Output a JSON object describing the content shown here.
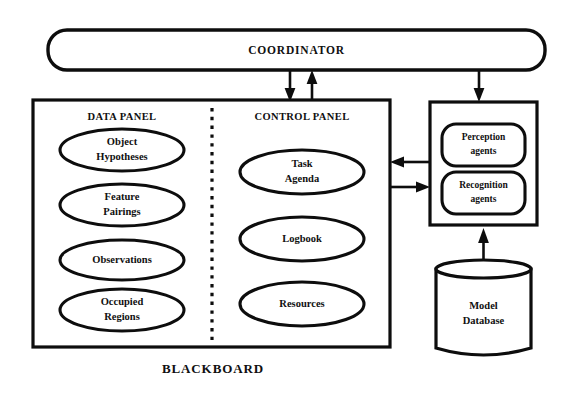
{
  "diagram": {
    "title_label": "BLACKBOARD",
    "coordinator": {
      "label": "COORDINATOR"
    },
    "blackboard": {
      "panels": [
        {
          "title": "DATA PANEL",
          "nodes": [
            {
              "line1": "Object",
              "line2": "Hypotheses"
            },
            {
              "line1": "Feature",
              "line2": "Pairings"
            },
            {
              "line1": "Observations",
              "line2": ""
            },
            {
              "line1": "Occupied",
              "line2": "Regions"
            }
          ]
        },
        {
          "title": "CONTROL PANEL",
          "nodes": [
            {
              "line1": "Task",
              "line2": "Agenda"
            },
            {
              "line1": "Logbook",
              "line2": ""
            },
            {
              "line1": "Resources",
              "line2": ""
            }
          ]
        }
      ]
    },
    "agents_box": {
      "agents": [
        {
          "line1": "Perception",
          "line2": "agents"
        },
        {
          "line1": "Recognition",
          "line2": "agents"
        }
      ]
    },
    "database": {
      "line1": "Model",
      "line2": "Database"
    },
    "colors": {
      "ink": "#0d0d0d",
      "paper": "#ffffff"
    }
  }
}
